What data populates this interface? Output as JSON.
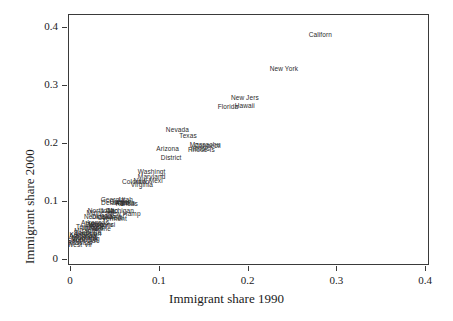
{
  "chart_data": {
    "type": "scatter",
    "title": "",
    "xlabel": "Immigrant share 1990",
    "ylabel": "Immigrant share 2000",
    "xlim": [
      0.0,
      0.4
    ],
    "ylim": [
      0.0,
      0.4
    ],
    "xticks": [
      "0",
      "0.1",
      "0.2",
      "0.3",
      "0.4"
    ],
    "xtickvalues": [
      0.0,
      0.1,
      0.2,
      0.3,
      0.4
    ],
    "yticks": [
      "0",
      "0.1",
      "0.2",
      "0.3",
      "0.4"
    ],
    "ytickvalues": [
      0.0,
      0.1,
      0.2,
      0.3,
      0.4
    ],
    "grid": false,
    "legend": false,
    "marker": "text-label",
    "note": "Each data point is rendered as its (truncated) state name text rather than a plotting symbol.",
    "points": [
      {
        "label": "Californ",
        "x": 0.282,
        "y": 0.387
      },
      {
        "label": "New York",
        "x": 0.241,
        "y": 0.327
      },
      {
        "label": "New Jers",
        "x": 0.197,
        "y": 0.277
      },
      {
        "label": "Hawaii",
        "x": 0.197,
        "y": 0.264
      },
      {
        "label": "Florida",
        "x": 0.178,
        "y": 0.262
      },
      {
        "label": "Nevada",
        "x": 0.121,
        "y": 0.223
      },
      {
        "label": "Texas",
        "x": 0.133,
        "y": 0.212
      },
      {
        "label": "Massachu",
        "x": 0.152,
        "y": 0.196
      },
      {
        "label": "Connecti",
        "x": 0.155,
        "y": 0.195
      },
      {
        "label": "Illinois",
        "x": 0.147,
        "y": 0.19
      },
      {
        "label": "Rhode Is",
        "x": 0.148,
        "y": 0.188
      },
      {
        "label": "Arizona",
        "x": 0.11,
        "y": 0.19
      },
      {
        "label": "District",
        "x": 0.114,
        "y": 0.175
      },
      {
        "label": "Washingt",
        "x": 0.092,
        "y": 0.15
      },
      {
        "label": "Maryland",
        "x": 0.092,
        "y": 0.142
      },
      {
        "label": "New Mexi",
        "x": 0.088,
        "y": 0.135
      },
      {
        "label": "Colorado",
        "x": 0.074,
        "y": 0.133
      },
      {
        "label": "Virginia",
        "x": 0.081,
        "y": 0.127
      },
      {
        "label": "Georgia",
        "x": 0.048,
        "y": 0.102
      },
      {
        "label": "Utah",
        "x": 0.063,
        "y": 0.102
      },
      {
        "label": "Oregon",
        "x": 0.057,
        "y": 0.098
      },
      {
        "label": "Alaska",
        "x": 0.062,
        "y": 0.097
      },
      {
        "label": "Delaware",
        "x": 0.051,
        "y": 0.096
      },
      {
        "label": "Kansas",
        "x": 0.064,
        "y": 0.095
      },
      {
        "label": "North Ca",
        "x": 0.035,
        "y": 0.083
      },
      {
        "label": "Michigan",
        "x": 0.057,
        "y": 0.083
      },
      {
        "label": "Idaho",
        "x": 0.045,
        "y": 0.082
      },
      {
        "label": "Minnesot",
        "x": 0.034,
        "y": 0.079
      },
      {
        "label": "New Hamp",
        "x": 0.061,
        "y": 0.078
      },
      {
        "label": "Nebraska",
        "x": 0.032,
        "y": 0.073
      },
      {
        "label": "Oklahoma",
        "x": 0.041,
        "y": 0.072
      },
      {
        "label": "Connecti2",
        "x": 0.046,
        "y": 0.071
      },
      {
        "label": "Vermont",
        "x": 0.05,
        "y": 0.069
      },
      {
        "label": "Arkansas",
        "x": 0.028,
        "y": 0.062
      },
      {
        "label": "Iowa",
        "x": 0.029,
        "y": 0.061
      },
      {
        "label": "Pennsylv",
        "x": 0.033,
        "y": 0.059
      },
      {
        "label": "Wisconsi",
        "x": 0.036,
        "y": 0.058
      },
      {
        "label": "Tennesse",
        "x": 0.023,
        "y": 0.055
      },
      {
        "label": "Indiana",
        "x": 0.025,
        "y": 0.054
      },
      {
        "label": "Ohio",
        "x": 0.024,
        "y": 0.052
      },
      {
        "label": "Maine",
        "x": 0.036,
        "y": 0.051
      },
      {
        "label": "Missouri",
        "x": 0.019,
        "y": 0.048
      },
      {
        "label": "South Ca",
        "x": 0.02,
        "y": 0.045
      },
      {
        "label": "Louisian",
        "x": 0.021,
        "y": 0.043
      },
      {
        "label": "Kentucky",
        "x": 0.015,
        "y": 0.041
      },
      {
        "label": "Alabama",
        "x": 0.014,
        "y": 0.039
      },
      {
        "label": "Montana",
        "x": 0.017,
        "y": 0.037
      },
      {
        "label": "Wyoming",
        "x": 0.018,
        "y": 0.035
      },
      {
        "label": "North Da",
        "x": 0.016,
        "y": 0.033
      },
      {
        "label": "South Da",
        "x": 0.013,
        "y": 0.031
      },
      {
        "label": "Mississi",
        "x": 0.012,
        "y": 0.028
      },
      {
        "label": "West Vir",
        "x": 0.011,
        "y": 0.025
      }
    ]
  }
}
